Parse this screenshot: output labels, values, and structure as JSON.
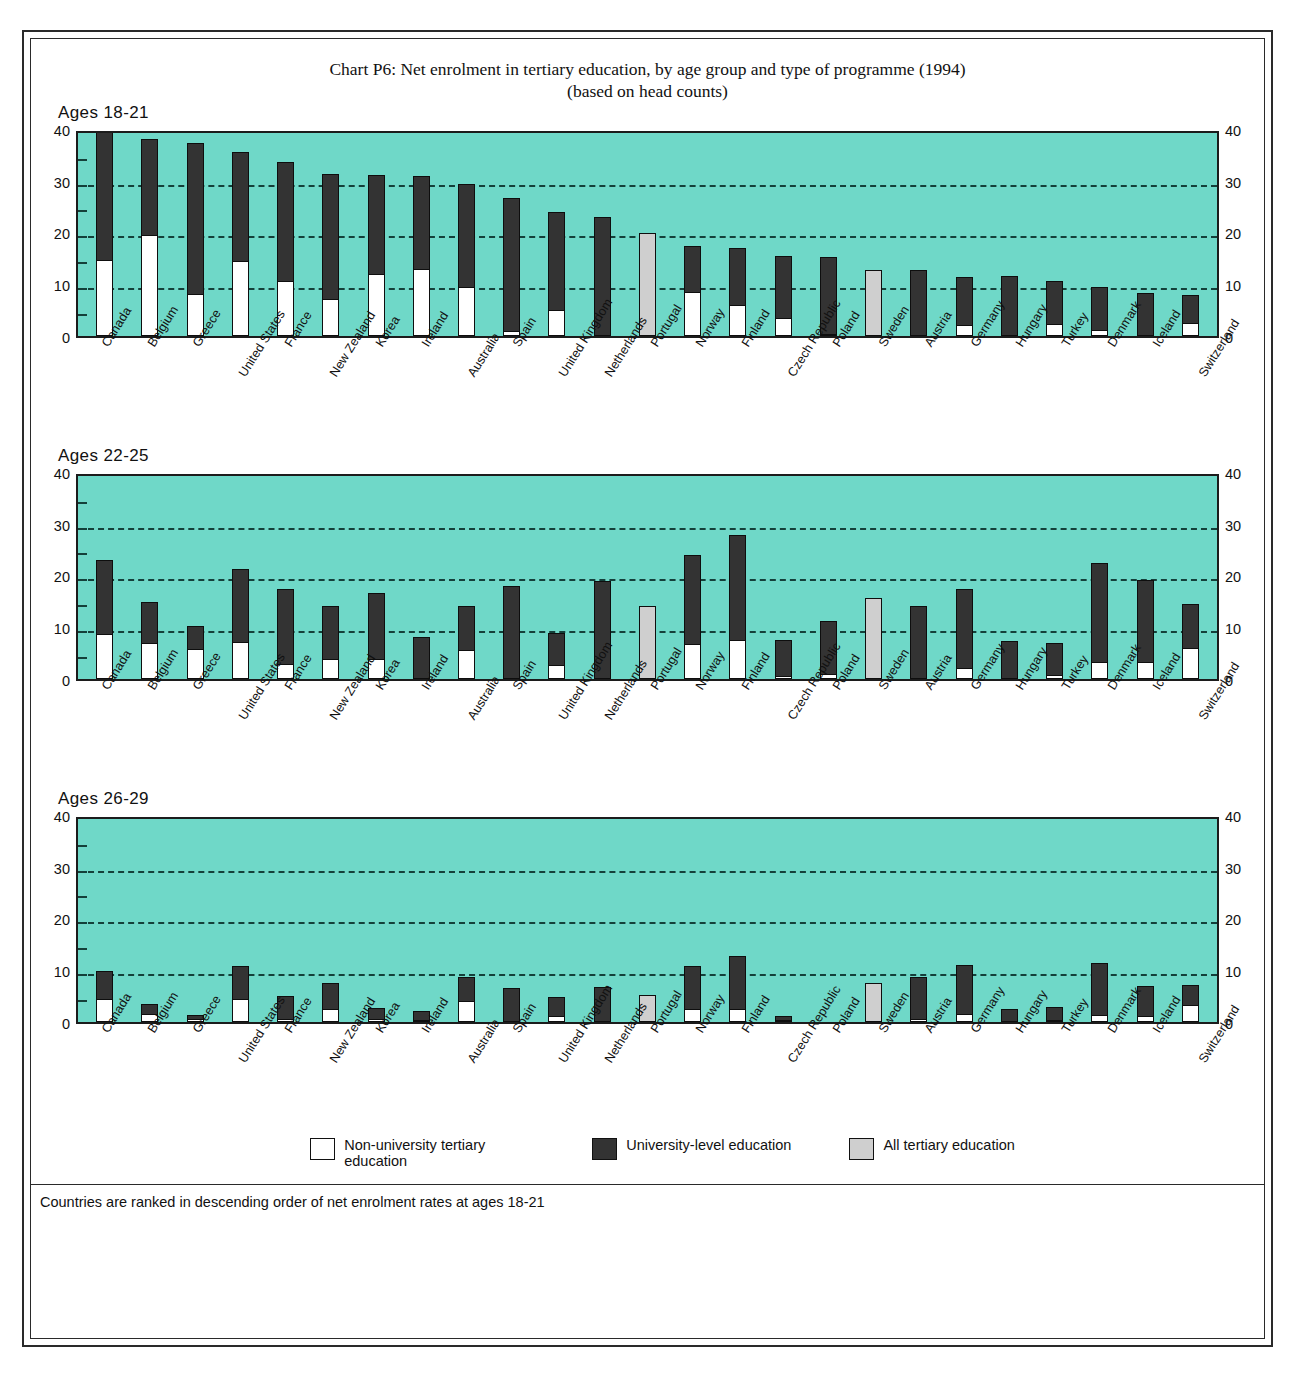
{
  "title": {
    "line1": "Chart P6: Net enrolment in tertiary education, by age group and type of programme (1994)",
    "line2": "(based on head counts)"
  },
  "panels": [
    {
      "label": "Ages 18-21"
    },
    {
      "label": "Ages 22-25"
    },
    {
      "label": "Ages 26-29"
    }
  ],
  "axis": {
    "ticks": [
      "40",
      "30",
      "20",
      "10",
      "0"
    ]
  },
  "legend": [
    {
      "key": "non-university",
      "label": "Non-university tertiary education",
      "color": "#ffffff"
    },
    {
      "key": "university",
      "label": "University-level education",
      "color": "#333333"
    },
    {
      "key": "all",
      "label": "All tertiary education",
      "color": "#cfcfcf"
    }
  ],
  "footnote": "Countries are ranked in descending order of net enrolment rates at ages 18-21",
  "colors": {
    "plot_background": "#6fd8c8",
    "non_university": "#ffffff",
    "university": "#333333",
    "all_tertiary": "#cfcfcf",
    "grid": "#14403a",
    "frame": "#2a2a2a"
  },
  "chart_data": [
    {
      "type": "bar",
      "title": "Ages 18-21",
      "subtitle": "Net enrolment in tertiary education (1994), based on head counts",
      "xlabel": "",
      "ylabel": "",
      "ylim": [
        0,
        40
      ],
      "yticks": [
        0,
        10,
        20,
        30,
        40
      ],
      "grid": "horizontal dashed at 10, 20, 30",
      "legend_position": "bottom",
      "stacked": true,
      "categories": [
        "Canada",
        "Belgium",
        "Greece",
        "United States",
        "France",
        "New Zealand",
        "Korea",
        "Ireland",
        "Australia",
        "Spain",
        "United Kingdom",
        "Netherlands",
        "Portugal",
        "Norway",
        "Finland",
        "Czech Republic",
        "Poland",
        "Sweden",
        "Austria",
        "Germany",
        "Hungary",
        "Turkey",
        "Denmark",
        "Iceland",
        "Switzerland"
      ],
      "series": [
        {
          "name": "Non-university tertiary education",
          "values": [
            14.5,
            19.2,
            7.8,
            14.3,
            10.3,
            7.0,
            11.7,
            12.8,
            9.3,
            0.8,
            4.8,
            0.0,
            null,
            8.3,
            5.8,
            3.2,
            0.2,
            null,
            0.0,
            1.9,
            0.0,
            2.1,
            1.0,
            0.0,
            2.2
          ]
        },
        {
          "name": "University-level education",
          "values": [
            26.5,
            18.9,
            29.5,
            21.2,
            23.3,
            24.2,
            19.4,
            18.1,
            20.0,
            25.9,
            19.1,
            23.0,
            null,
            9.1,
            11.2,
            12.2,
            15.0,
            null,
            12.8,
            9.5,
            11.6,
            8.4,
            8.4,
            8.2,
            5.6
          ]
        },
        {
          "name": "All tertiary education",
          "values": [
            null,
            null,
            null,
            null,
            null,
            null,
            null,
            null,
            null,
            null,
            null,
            null,
            19.8,
            null,
            null,
            null,
            null,
            12.8,
            null,
            null,
            null,
            null,
            null,
            null,
            null
          ]
        }
      ],
      "totals": [
        41.0,
        38.1,
        37.3,
        35.5,
        33.6,
        31.2,
        31.1,
        30.9,
        29.3,
        26.7,
        23.9,
        23.0,
        19.8,
        17.4,
        17.0,
        15.4,
        15.2,
        12.8,
        12.8,
        11.4,
        11.6,
        10.5,
        9.4,
        8.2,
        7.8
      ]
    },
    {
      "type": "bar",
      "title": "Ages 22-25",
      "xlabel": "",
      "ylabel": "",
      "ylim": [
        0,
        40
      ],
      "yticks": [
        0,
        10,
        20,
        30,
        40
      ],
      "grid": "horizontal dashed at 10, 20, 30",
      "legend_position": "bottom",
      "stacked": true,
      "categories": [
        "Canada",
        "Belgium",
        "Greece",
        "United States",
        "France",
        "New Zealand",
        "Korea",
        "Ireland",
        "Australia",
        "Spain",
        "United Kingdom",
        "Netherlands",
        "Portugal",
        "Norway",
        "Finland",
        "Czech Republic",
        "Poland",
        "Sweden",
        "Austria",
        "Germany",
        "Hungary",
        "Turkey",
        "Denmark",
        "Iceland",
        "Switzerland"
      ],
      "series": [
        {
          "name": "Non-university tertiary education",
          "values": [
            8.5,
            6.8,
            5.5,
            7.0,
            2.7,
            3.6,
            3.7,
            0.0,
            5.4,
            0.0,
            2.5,
            0.0,
            null,
            6.5,
            7.4,
            0.3,
            0.8,
            null,
            0.0,
            1.8,
            0.0,
            0.6,
            3.0,
            3.0,
            5.7
          ]
        },
        {
          "name": "University-level education",
          "values": [
            14.5,
            8.0,
            4.8,
            14.2,
            14.6,
            10.4,
            12.9,
            8.0,
            8.6,
            17.9,
            6.4,
            18.9,
            null,
            17.5,
            20.4,
            7.2,
            10.3,
            null,
            14.0,
            15.5,
            7.3,
            6.4,
            19.3,
            16.0,
            8.7
          ]
        },
        {
          "name": "All tertiary education",
          "values": [
            null,
            null,
            null,
            null,
            null,
            null,
            null,
            null,
            null,
            null,
            null,
            null,
            14.0,
            null,
            null,
            null,
            null,
            15.7,
            null,
            null,
            null,
            null,
            null,
            null,
            null
          ]
        }
      ],
      "totals": [
        23.0,
        14.8,
        10.3,
        21.2,
        17.3,
        14.0,
        16.6,
        8.0,
        14.0,
        17.9,
        8.9,
        18.9,
        14.0,
        24.0,
        27.8,
        7.5,
        11.1,
        15.7,
        14.0,
        17.3,
        7.3,
        7.0,
        22.3,
        19.0,
        14.4
      ]
    },
    {
      "type": "bar",
      "title": "Ages 26-29",
      "xlabel": "",
      "ylabel": "",
      "ylim": [
        0,
        40
      ],
      "yticks": [
        0,
        10,
        20,
        30,
        40
      ],
      "grid": "horizontal dashed at 10, 20, 30",
      "legend_position": "bottom",
      "stacked": true,
      "categories": [
        "Canada",
        "Belgium",
        "Greece",
        "United States",
        "France",
        "New Zealand",
        "Korea",
        "Ireland",
        "Australia",
        "Spain",
        "United Kingdom",
        "Netherlands",
        "Portugal",
        "Norway",
        "Finland",
        "Czech Republic",
        "Poland",
        "Sweden",
        "Austria",
        "Germany",
        "Hungary",
        "Turkey",
        "Denmark",
        "Iceland",
        "Switzerland"
      ],
      "series": [
        {
          "name": "Non-university tertiary education",
          "values": [
            4.3,
            1.3,
            0.4,
            4.3,
            0.3,
            2.3,
            0.4,
            0.2,
            3.8,
            0.0,
            1.0,
            0.0,
            null,
            2.2,
            2.2,
            0.1,
            0.0,
            null,
            0.3,
            1.3,
            0.0,
            0.2,
            1.2,
            0.9,
            3.0
          ]
        },
        {
          "name": "University-level education",
          "values": [
            5.5,
            2.2,
            1.0,
            6.5,
            4.7,
            5.2,
            2.3,
            1.9,
            4.9,
            6.6,
            3.7,
            6.7,
            null,
            8.6,
            10.5,
            1.0,
            0.0,
            null,
            8.4,
            9.7,
            2.5,
            2.6,
            10.2,
            6.0,
            4.2
          ]
        },
        {
          "name": "All tertiary education",
          "values": [
            null,
            null,
            null,
            null,
            null,
            null,
            null,
            null,
            null,
            null,
            null,
            null,
            5.2,
            null,
            null,
            null,
            null,
            7.5,
            null,
            null,
            null,
            null,
            null,
            null,
            null
          ]
        }
      ],
      "totals": [
        9.8,
        3.5,
        1.4,
        10.8,
        5.0,
        7.5,
        2.7,
        2.1,
        8.7,
        6.6,
        4.7,
        6.7,
        5.2,
        10.8,
        12.7,
        1.1,
        0.0,
        7.5,
        8.7,
        11.0,
        2.5,
        2.8,
        11.4,
        6.9,
        7.2
      ]
    }
  ]
}
